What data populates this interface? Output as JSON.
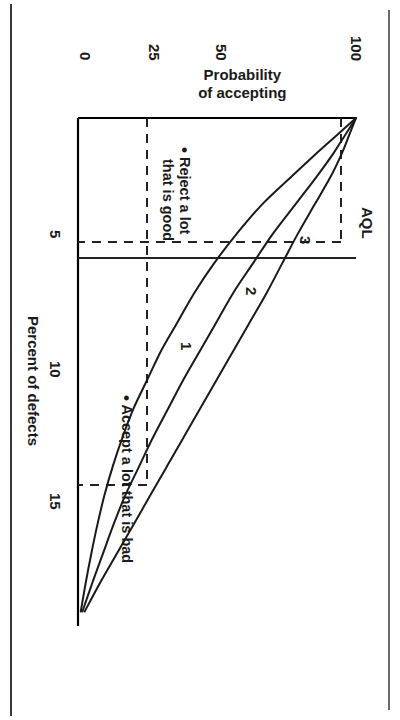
{
  "figure": {
    "kind": "operating-characteristic-curve"
  },
  "chart_data": {
    "type": "line",
    "title": "",
    "xlabel": "Percent of defects",
    "ylabel": "Probability of accepting",
    "xlim": [
      0,
      17.5
    ],
    "ylim": [
      0,
      100
    ],
    "xticks": [
      5,
      10,
      15
    ],
    "xticklabels": [
      "5",
      "10",
      "15"
    ],
    "yticks": [
      0,
      25,
      50,
      100
    ],
    "yticklabels": [
      "0",
      "25",
      "50",
      "100"
    ],
    "grid": false,
    "legend": "inline curve labels",
    "series": [
      {
        "name": "1",
        "label": "1",
        "x": [
          0,
          0.6,
          1.2,
          2,
          3,
          4,
          5,
          6,
          7,
          8,
          9,
          10,
          11,
          12,
          13,
          14,
          15,
          16,
          17
        ],
        "y": [
          100,
          93,
          86,
          77,
          66,
          57,
          49,
          42,
          36,
          30,
          25,
          20,
          16,
          12.5,
          9.5,
          7,
          4.8,
          2.8,
          1
        ]
      },
      {
        "name": "2",
        "label": "2",
        "x": [
          0,
          0.6,
          1.2,
          2,
          3,
          4,
          5,
          6,
          7,
          8,
          9,
          10,
          11,
          12,
          13,
          14,
          15,
          16,
          17
        ],
        "y": [
          100,
          96,
          92,
          86,
          78,
          70,
          63,
          56,
          50,
          44,
          38,
          32.5,
          27,
          22,
          17,
          12.8,
          9,
          5.2,
          1.6
        ]
      },
      {
        "name": "3",
        "label": "3",
        "x": [
          0,
          0.6,
          1.2,
          2,
          3,
          4,
          5,
          6,
          7,
          8,
          9,
          10,
          11,
          12,
          13,
          14,
          15,
          16,
          17
        ],
        "y": [
          100,
          97.5,
          95,
          91,
          85,
          79,
          73.5,
          68,
          62,
          56,
          50,
          44,
          38,
          32,
          26,
          20,
          14,
          8,
          2.4
        ]
      }
    ],
    "reference_lines": [
      {
        "name": "AQL",
        "label": "AQL",
        "orientation": "vertical",
        "x": 5,
        "style": "solid"
      },
      {
        "name": "high-probability",
        "orientation": "horizontal",
        "y": 95,
        "style": "dashed"
      },
      {
        "name": "low-probability",
        "orientation": "horizontal",
        "y": 25,
        "style": "dashed"
      },
      {
        "name": "aql-drop",
        "orientation": "vertical",
        "x": 4.2,
        "style": "dashed"
      },
      {
        "name": "rqd-drop",
        "orientation": "vertical",
        "x": 12.6,
        "style": "dashed"
      }
    ],
    "annotations": [
      {
        "name": "reject-a-lot-that-is-good",
        "text": "Reject a lot\nthat is good",
        "bullet": true,
        "x": 2.2,
        "y": 60
      },
      {
        "name": "accept-a-lot-that-is-bad",
        "text": "Accept a lot that is bad",
        "bullet": true,
        "x": 9.5,
        "y": 14
      }
    ]
  },
  "axes": {
    "y_title_line1": "Probability",
    "y_title_line2": "of accepting",
    "x_title": "Percent of defects",
    "yticks": {
      "t100": "100",
      "t50": "50",
      "t25": "25",
      "t0": "0"
    },
    "xticks": {
      "t5": "5",
      "t10": "10",
      "t15": "15"
    }
  },
  "labels": {
    "aql": "AQL",
    "curve1": "1",
    "curve2": "2",
    "curve3": "3"
  },
  "annotations": {
    "reject_bullet": "•",
    "reject_line1": "Reject a lot",
    "reject_line2": "that is good",
    "accept_bullet": "•",
    "accept_text": "Accept a lot that is bad"
  },
  "colors": {
    "ink": "#1a1a1a",
    "axis": "#000000",
    "paper": "#ffffff"
  }
}
